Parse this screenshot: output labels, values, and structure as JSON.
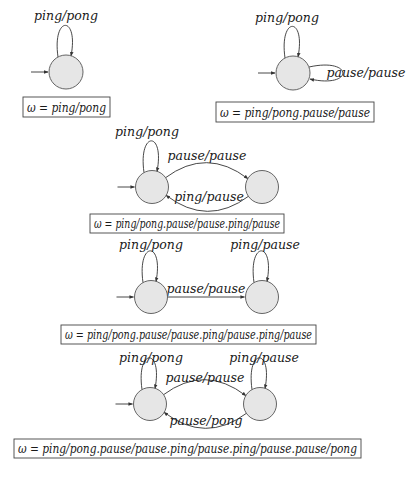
{
  "diagrams": [
    {
      "states": [
        {
          "id": "q0",
          "cx": 66,
          "cy": 72,
          "r": 17,
          "initial": true
        }
      ],
      "transitions": [
        {
          "type": "self-top",
          "state": "q0",
          "label": "ping/pong",
          "label_x": 66,
          "label_y": 20
        }
      ],
      "word_box": {
        "x": 23,
        "y": 97,
        "w": 87,
        "h": 20,
        "text": "ω = ping/pong"
      }
    },
    {
      "states": [
        {
          "id": "q0",
          "cx": 293,
          "cy": 73,
          "r": 17,
          "initial": true
        }
      ],
      "transitions": [
        {
          "type": "self-top",
          "state": "q0",
          "label": "ping/pong",
          "label_x": 287,
          "label_y": 22
        },
        {
          "type": "self-right",
          "state": "q0",
          "label": "pause/pause",
          "label_x": 366,
          "label_y": 77
        }
      ],
      "word_box": {
        "x": 216,
        "y": 102,
        "w": 158,
        "h": 20,
        "text": "ω = ping/pong.pause/pause"
      }
    },
    {
      "states": [
        {
          "id": "q0",
          "cx": 152,
          "cy": 187,
          "r": 16.5,
          "initial": true
        },
        {
          "id": "q1",
          "cx": 262,
          "cy": 187,
          "r": 16.5,
          "initial": false
        }
      ],
      "transitions": [
        {
          "type": "self-top",
          "state": "q0",
          "label": "ping/pong",
          "label_x": 147,
          "label_y": 136
        },
        {
          "type": "arc-top",
          "from": "q0",
          "to": "q1",
          "label": "pause/pause",
          "label_x": 207,
          "label_y": 160
        },
        {
          "type": "arc-bottom",
          "from": "q1",
          "to": "q0",
          "label": "ping/pause",
          "label_x": 209,
          "label_y": 201
        }
      ],
      "word_box": {
        "x": 90,
        "y": 214,
        "w": 194,
        "h": 19,
        "text": "ω = ping/pong.pause/pause.ping/pause"
      }
    },
    {
      "states": [
        {
          "id": "q0",
          "cx": 151,
          "cy": 297,
          "r": 16.5,
          "initial": true
        },
        {
          "id": "q1",
          "cx": 262,
          "cy": 297,
          "r": 16.5,
          "initial": false
        }
      ],
      "transitions": [
        {
          "type": "self-top",
          "state": "q0",
          "label": "ping/pong",
          "label_x": 151,
          "label_y": 249
        },
        {
          "type": "self-top",
          "state": "q1",
          "label": "ping/pause",
          "label_x": 265,
          "label_y": 249
        },
        {
          "type": "straight",
          "from": "q0",
          "to": "q1",
          "label": "pause/pause",
          "label_x": 206,
          "label_y": 293
        }
      ],
      "word_box": {
        "x": 61,
        "y": 325,
        "w": 255,
        "h": 19,
        "text": "ω = ping/pong.pause/pause.ping/pause.ping/pause"
      }
    },
    {
      "states": [
        {
          "id": "q0",
          "cx": 150,
          "cy": 404,
          "r": 16.5,
          "initial": true
        },
        {
          "id": "q1",
          "cx": 260,
          "cy": 404,
          "r": 16.5,
          "initial": false
        }
      ],
      "transitions": [
        {
          "type": "self-top",
          "state": "q0",
          "label": "ping/pong",
          "label_x": 151,
          "label_y": 362
        },
        {
          "type": "self-top",
          "state": "q1",
          "label": "ping/pause",
          "label_x": 264,
          "label_y": 362
        },
        {
          "type": "arc-top",
          "from": "q0",
          "to": "q1",
          "label": "pause/pause",
          "label_x": 205,
          "label_y": 382
        },
        {
          "type": "arc-bottom",
          "from": "q1",
          "to": "q0",
          "label": "pause/pong",
          "label_x": 206,
          "label_y": 425
        }
      ],
      "word_box": {
        "x": 14,
        "y": 439,
        "w": 347,
        "h": 19,
        "text": "ω = ping/pong.pause/pause.ping/pause.ping/pause.pause/pong"
      }
    }
  ]
}
